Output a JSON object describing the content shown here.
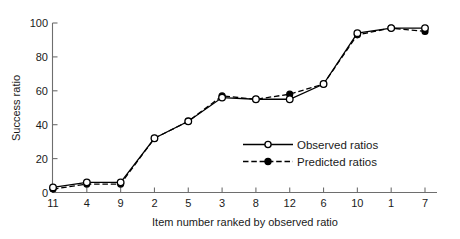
{
  "chart_data": {
    "type": "line",
    "title": "",
    "xlabel": "Item number ranked by observed ratio",
    "ylabel": "Success ratio",
    "categories": [
      "11",
      "4",
      "9",
      "2",
      "5",
      "3",
      "8",
      "12",
      "6",
      "10",
      "1",
      "7"
    ],
    "x_tick_labels": [
      "11",
      "4",
      "9",
      "2",
      "5",
      "3",
      "8",
      "12",
      "6",
      "10",
      "1",
      "7"
    ],
    "y_tick_labels": [
      "0",
      "20",
      "40",
      "60",
      "80",
      "100"
    ],
    "y_ticks": [
      0,
      20,
      40,
      60,
      80,
      100
    ],
    "ylim": [
      0,
      100
    ],
    "grid": false,
    "legend_position": "center-right-inside",
    "series": [
      {
        "name": "Observed ratios",
        "marker": "open-circle",
        "line_style": "solid",
        "color": "#000000",
        "values": [
          3,
          6,
          6,
          32,
          42,
          56,
          55,
          55,
          64,
          94,
          97,
          97
        ]
      },
      {
        "name": "Predicted ratios",
        "marker": "filled-circle",
        "line_style": "dashed",
        "color": "#000000",
        "values": [
          2,
          5,
          5,
          32,
          42,
          57,
          55,
          58,
          64,
          93,
          97,
          95
        ]
      }
    ]
  },
  "legend": {
    "items": [
      {
        "label": "Observed ratios",
        "style": "solid",
        "marker": "open-circle"
      },
      {
        "label": "Predicted ratios",
        "style": "dashed",
        "marker": "filled-circle"
      }
    ]
  },
  "axes": {
    "y_axis_title": "Success ratio",
    "x_axis_title": "Item number ranked by observed ratio"
  },
  "colors": {
    "ink": "#000000",
    "axis": "#6e6e6e",
    "background": "#ffffff"
  }
}
